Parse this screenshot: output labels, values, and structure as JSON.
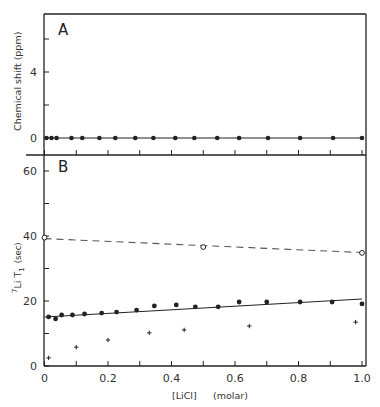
{
  "chart_data": [
    {
      "panel": "A",
      "type": "scatter",
      "title": "",
      "panel_label": "A",
      "xlabel": "[LiCl]  (molar)",
      "ylabel": "Chemical shift  (ppm)",
      "xlim": [
        0,
        1.0
      ],
      "ylim": [
        -1,
        7.5
      ],
      "yticks": [
        0,
        2,
        4,
        6
      ],
      "ytick_labels": [
        "0",
        "",
        "4",
        ""
      ],
      "xticks": [
        0,
        0.1,
        0.2,
        0.3,
        0.4,
        0.5,
        0.6,
        0.7,
        0.8,
        0.9,
        1.0
      ],
      "grid": false,
      "series": [
        {
          "name": "chemical shift",
          "marker": "filled-circle",
          "x": [
            0.006,
            0.022,
            0.038,
            0.085,
            0.119,
            0.173,
            0.223,
            0.286,
            0.343,
            0.412,
            0.472,
            0.544,
            0.613,
            0.704,
            0.805,
            0.909,
            1.0
          ],
          "y": [
            0,
            0,
            0,
            0,
            0,
            0,
            0,
            0,
            0,
            0,
            0,
            0,
            0,
            0,
            0,
            0,
            0
          ]
        },
        {
          "name": "fit",
          "line": "solid",
          "x": [
            0,
            1.0
          ],
          "y": [
            0,
            0
          ]
        }
      ]
    },
    {
      "panel": "B",
      "type": "scatter",
      "title": "",
      "panel_label": "B",
      "xlabel": "[LiCl]  (molar)",
      "ylabel": "7Li  T1 (sec)",
      "xlim": [
        0,
        1.0
      ],
      "ylim": [
        0,
        65
      ],
      "yticks": [
        0,
        10,
        20,
        30,
        40,
        50,
        60
      ],
      "ytick_labels": [
        "0",
        "",
        "20",
        "",
        "40",
        "",
        "60"
      ],
      "xticks": [
        0,
        0.1,
        0.2,
        0.3,
        0.4,
        0.5,
        0.6,
        0.7,
        0.8,
        0.9,
        1.0
      ],
      "xtick_labels": [
        "0",
        "",
        "0.2",
        "",
        "0.4",
        "",
        "0.6",
        "",
        "0.8",
        "",
        "1.0"
      ],
      "grid": false,
      "series": [
        {
          "name": "open circles",
          "marker": "open-circle",
          "x": [
            0.0,
            0.5,
            1.0
          ],
          "y": [
            39.5,
            36.6,
            34.8
          ]
        },
        {
          "name": "open circles fit",
          "line": "dashed",
          "x": [
            0,
            1.0
          ],
          "y": [
            39.2,
            34.9
          ]
        },
        {
          "name": "filled circles",
          "marker": "filled-circle",
          "x": [
            0.013,
            0.035,
            0.054,
            0.088,
            0.126,
            0.18,
            0.227,
            0.29,
            0.346,
            0.415,
            0.475,
            0.547,
            0.613,
            0.7,
            0.805,
            0.906,
            1.0
          ],
          "y": [
            15.1,
            14.5,
            15.7,
            15.7,
            16.0,
            16.3,
            16.6,
            17.2,
            18.5,
            18.8,
            18.2,
            18.2,
            19.7,
            19.7,
            19.7,
            19.7,
            19.1
          ]
        },
        {
          "name": "filled circles fit",
          "line": "solid",
          "x": [
            0,
            1.0
          ],
          "y": [
            15.1,
            20.6
          ]
        },
        {
          "name": "crosses",
          "marker": "plus",
          "x": [
            0.013,
            0.1,
            0.2,
            0.33,
            0.44,
            0.645,
            0.98
          ],
          "y": [
            2.5,
            5.8,
            8.0,
            10.2,
            11.1,
            12.3,
            13.5
          ]
        }
      ]
    }
  ],
  "labels": {
    "panel_a": "A",
    "panel_b": "B",
    "ylabel_a": "Chemical shift  (ppm)",
    "ylabel_b_prefix": "7",
    "ylabel_b_main": "Li  T",
    "ylabel_b_sub": "1",
    "ylabel_b_unit": "(sec)",
    "xlabel": "[LiCl]",
    "xlabel_unit": "(molar)"
  }
}
